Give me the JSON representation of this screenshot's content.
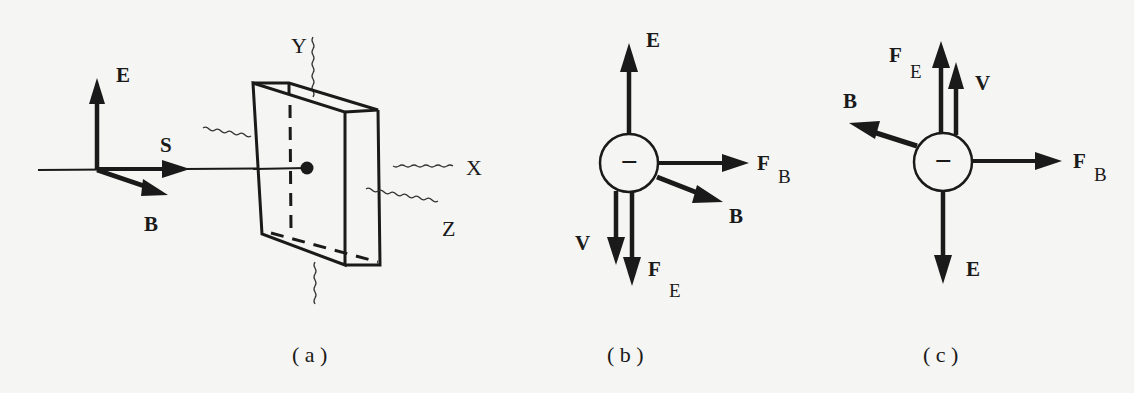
{
  "figure": {
    "background": "#f5f5f3",
    "ink": "#1a1a1a",
    "panels": [
      {
        "id": "a",
        "caption": "( a )",
        "vectors": [
          {
            "name": "E",
            "label": "E",
            "direction": "up"
          },
          {
            "name": "S",
            "label": "S",
            "direction": "right"
          },
          {
            "name": "B",
            "label": "B",
            "direction": "down-right"
          }
        ],
        "axes": [
          {
            "name": "X",
            "label": "X"
          },
          {
            "name": "Y",
            "label": "Y"
          },
          {
            "name": "Z",
            "label": "Z"
          }
        ],
        "object": "rectangular slab (crystal) with incident ray hitting center point"
      },
      {
        "id": "b",
        "caption": "( b )",
        "particle_sign": "−",
        "vectors": [
          {
            "name": "E",
            "label": "E",
            "direction": "up"
          },
          {
            "name": "F_B",
            "label": "F",
            "subscript": "B",
            "direction": "right"
          },
          {
            "name": "B",
            "label": "B",
            "direction": "down-right"
          },
          {
            "name": "V",
            "label": "V",
            "direction": "down"
          },
          {
            "name": "F_E",
            "label": "F",
            "subscript": "E",
            "direction": "down"
          }
        ]
      },
      {
        "id": "c",
        "caption": "( c )",
        "particle_sign": "−",
        "vectors": [
          {
            "name": "F_E",
            "label": "F",
            "subscript": "E",
            "direction": "up"
          },
          {
            "name": "V",
            "label": "V",
            "direction": "up"
          },
          {
            "name": "B",
            "label": "B",
            "direction": "up-left"
          },
          {
            "name": "F_B",
            "label": "F",
            "subscript": "B",
            "direction": "right"
          },
          {
            "name": "E",
            "label": "E",
            "direction": "down"
          }
        ]
      }
    ]
  }
}
